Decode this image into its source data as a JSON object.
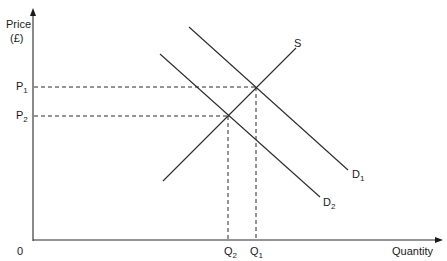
{
  "diagram": {
    "type": "supply-demand",
    "axes": {
      "y_label_line1": "Price",
      "y_label_line2": "(£)",
      "x_label": "Quantity",
      "origin_label": "0"
    },
    "curves": {
      "supply": {
        "label": "S"
      },
      "demand_1": {
        "label": "D",
        "sub": "1"
      },
      "demand_2": {
        "label": "D",
        "sub": "2"
      }
    },
    "price_levels": [
      {
        "label": "P",
        "sub": "1"
      },
      {
        "label": "P",
        "sub": "2"
      }
    ],
    "quantity_levels": [
      {
        "label": "Q",
        "sub": "2"
      },
      {
        "label": "Q",
        "sub": "1"
      }
    ],
    "colors": {
      "line": "#2a2a2a",
      "background": "#ffffff"
    }
  }
}
